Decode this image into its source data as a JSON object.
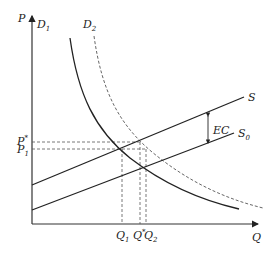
{
  "diagram": {
    "type": "supply-demand-externality",
    "axes": {
      "y_label": "P",
      "x_label": "Q"
    },
    "curves": {
      "D1": {
        "label": "D",
        "sub": "1",
        "style": "solid"
      },
      "D2": {
        "label": "D",
        "sub": "2",
        "style": "dashed"
      },
      "S": {
        "label": "S",
        "sub": "",
        "style": "solid"
      },
      "S0": {
        "label": "S",
        "sub": "0",
        "style": "solid"
      }
    },
    "price_labels": {
      "p_star": {
        "label": "P",
        "sup": "*"
      },
      "p1": {
        "label": "P",
        "sub": "1"
      }
    },
    "quantity_labels": {
      "q1": {
        "label": "Q",
        "sub": "1"
      },
      "q_star": {
        "label": "Q",
        "sup": "*"
      },
      "q2": {
        "label": "Q",
        "sub": "2"
      }
    },
    "annotation": {
      "ec": "EC"
    },
    "colors": {
      "line": "#222222",
      "dash": "#555555"
    }
  }
}
